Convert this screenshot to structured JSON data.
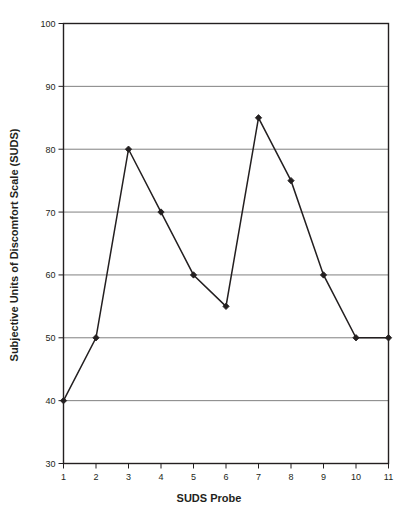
{
  "chart_data": {
    "type": "line",
    "title": "",
    "xlabel": "SUDS Probe",
    "ylabel": "Subjective Units of Discomfort Scale (SUDS)",
    "x": [
      1,
      2,
      3,
      4,
      5,
      6,
      7,
      8,
      9,
      10,
      11
    ],
    "categories": [
      "1",
      "2",
      "3",
      "4",
      "5",
      "6",
      "7",
      "8",
      "9",
      "10",
      "11"
    ],
    "values": [
      40,
      50,
      80,
      70,
      60,
      55,
      85,
      75,
      60,
      50,
      50
    ],
    "series": [
      {
        "name": "SUDS",
        "values": [
          40,
          50,
          80,
          70,
          60,
          55,
          85,
          75,
          60,
          50,
          50
        ]
      }
    ],
    "xlim": [
      1,
      11
    ],
    "ylim": [
      30,
      100
    ],
    "xticks": [
      "1",
      "2",
      "3",
      "4",
      "5",
      "6",
      "7",
      "8",
      "9",
      "10",
      "11"
    ],
    "yticks": [
      "30",
      "40",
      "50",
      "60",
      "70",
      "80",
      "90",
      "100"
    ],
    "ytick_values": [
      30,
      40,
      50,
      60,
      70,
      80,
      90,
      100
    ],
    "grid": "horizontal",
    "legend": "none",
    "marker": "diamond",
    "line_color": "#231f20",
    "marker_color": "#231f20",
    "grid_color": "#808080",
    "axis_color": "#231f20",
    "background_color": "#ffffff"
  }
}
